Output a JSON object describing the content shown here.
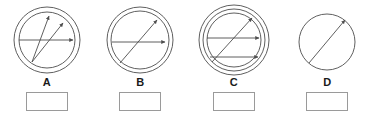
{
  "page": {
    "background_color": "#ffffff",
    "width": 374,
    "height": 123
  },
  "style": {
    "stroke_color": "#4d4d4d",
    "arrow_color": "#4d4d4d",
    "box_border_color": "#9a9a9a",
    "label_color": "#1a1a1a"
  },
  "figures": [
    {
      "label": "A",
      "circle_count": 2,
      "arrow_count": 3,
      "answer_value": "",
      "answer_placeholder": "",
      "circles": [
        {
          "cx": 40,
          "cy": 40,
          "r": 33
        },
        {
          "cx": 40,
          "cy": 40,
          "r": 28
        }
      ],
      "arrows": [
        {
          "x1": 25,
          "y1": 62,
          "x2": 42,
          "y2": 16
        },
        {
          "x1": 25,
          "y1": 62,
          "x2": 56,
          "y2": 23
        },
        {
          "x1": 12,
          "y1": 40,
          "x2": 66,
          "y2": 40
        }
      ]
    },
    {
      "label": "B",
      "circle_count": 2,
      "arrow_count": 2,
      "answer_value": "",
      "answer_placeholder": "",
      "circles": [
        {
          "cx": 40,
          "cy": 40,
          "r": 33
        },
        {
          "cx": 40,
          "cy": 40,
          "r": 29
        }
      ],
      "arrows": [
        {
          "x1": 20,
          "y1": 63,
          "x2": 57,
          "y2": 20
        },
        {
          "x1": 12,
          "y1": 42,
          "x2": 65,
          "y2": 42
        }
      ]
    },
    {
      "label": "C",
      "circle_count": 3,
      "arrow_count": 3,
      "answer_value": "",
      "answer_placeholder": "",
      "circles": [
        {
          "cx": 40,
          "cy": 40,
          "r": 35
        },
        {
          "cx": 40,
          "cy": 40,
          "r": 31
        },
        {
          "cx": 40,
          "cy": 40,
          "r": 27
        }
      ],
      "arrows": [
        {
          "x1": 18,
          "y1": 62,
          "x2": 58,
          "y2": 18
        },
        {
          "x1": 13,
          "y1": 38,
          "x2": 65,
          "y2": 38
        },
        {
          "x1": 16,
          "y1": 57,
          "x2": 64,
          "y2": 57
        }
      ]
    },
    {
      "label": "D",
      "circle_count": 1,
      "arrow_count": 1,
      "answer_value": "",
      "answer_placeholder": "",
      "circles": [
        {
          "cx": 40,
          "cy": 42,
          "r": 28
        }
      ],
      "arrows": [
        {
          "x1": 22,
          "y1": 63,
          "x2": 58,
          "y2": 20
        }
      ]
    }
  ]
}
